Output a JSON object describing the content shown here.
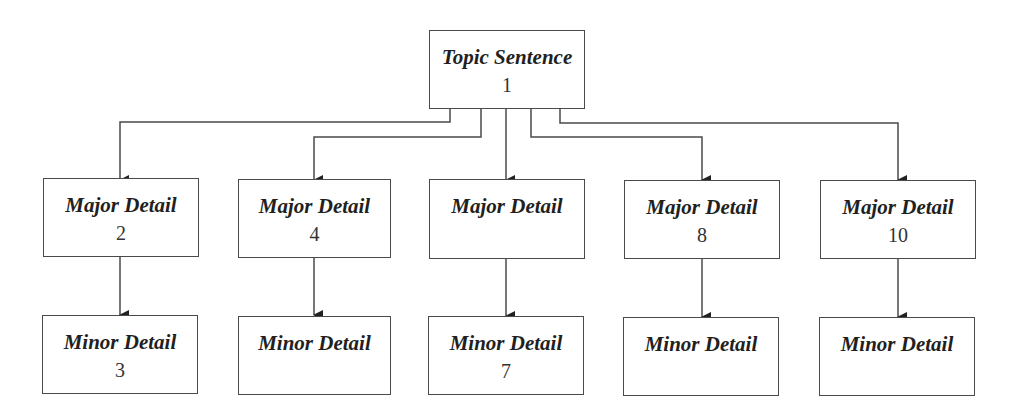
{
  "diagram": {
    "type": "hierarchy",
    "colors": {
      "stroke": "#4a4a4a",
      "text": "#231f20",
      "background": "#ffffff"
    },
    "topic": {
      "title": "Topic Sentence",
      "number": "1"
    },
    "columns": [
      {
        "major": {
          "title": "Major Detail",
          "number": "2"
        },
        "minor": {
          "title": "Minor Detail",
          "number": "3"
        }
      },
      {
        "major": {
          "title": "Major Detail",
          "number": "4"
        },
        "minor": {
          "title": "Minor Detail",
          "number": ""
        }
      },
      {
        "major": {
          "title": "Major Detail",
          "number": ""
        },
        "minor": {
          "title": "Minor Detail",
          "number": "7"
        }
      },
      {
        "major": {
          "title": "Major Detail",
          "number": "8"
        },
        "minor": {
          "title": "Minor Detail",
          "number": ""
        }
      },
      {
        "major": {
          "title": "Major Detail",
          "number": "10"
        },
        "minor": {
          "title": "Minor Detail",
          "number": ""
        }
      }
    ],
    "edges": [
      {
        "from": "topic",
        "to": "major-0"
      },
      {
        "from": "topic",
        "to": "major-1"
      },
      {
        "from": "topic",
        "to": "major-2"
      },
      {
        "from": "topic",
        "to": "major-3"
      },
      {
        "from": "topic",
        "to": "major-4"
      },
      {
        "from": "major-0",
        "to": "minor-0"
      },
      {
        "from": "major-1",
        "to": "minor-1"
      },
      {
        "from": "major-2",
        "to": "minor-2"
      },
      {
        "from": "major-3",
        "to": "minor-3"
      },
      {
        "from": "major-4",
        "to": "minor-4"
      }
    ]
  }
}
